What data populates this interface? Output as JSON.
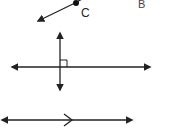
{
  "diagram": {
    "labels": {
      "point_c": "C",
      "point_b": "B",
      "point_a_partial": "A"
    },
    "figures": [
      {
        "name": "ray-from-c",
        "description": "Ray starting at point C pointing down-left"
      },
      {
        "name": "perpendicular-lines",
        "description": "Vertical and horizontal lines intersecting with right-angle marker"
      },
      {
        "name": "parallel-line",
        "description": "Horizontal line with arrows at both ends and a parallel tick mark"
      }
    ],
    "colors": {
      "stroke": "#222222",
      "background": "#ffffff"
    }
  }
}
